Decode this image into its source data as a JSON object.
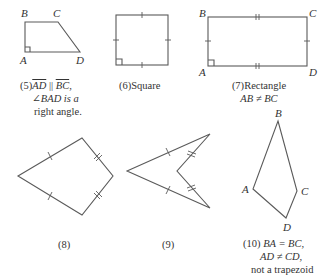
{
  "figures": [
    {
      "id": 5,
      "vertices": {
        "A": "A",
        "B": "B",
        "C": "C",
        "D": "D"
      },
      "caption": {
        "number": "(5)",
        "seg1": "AD",
        "parallel": "||",
        "seg2": "BC",
        "comma": ",",
        "line2": "∠BAD is a",
        "line3": "right angle."
      }
    },
    {
      "id": 6,
      "caption": {
        "number": "(6)",
        "text": "Square"
      }
    },
    {
      "id": 7,
      "vertices": {
        "A": "A",
        "B": "B",
        "C": "C",
        "D": "D"
      },
      "caption": {
        "number": "(7)",
        "text": "Rectangle",
        "line2": "AB ≠ BC"
      }
    },
    {
      "id": 8,
      "caption": {
        "number": "(8)"
      }
    },
    {
      "id": 9,
      "caption": {
        "number": "(9)"
      }
    },
    {
      "id": 10,
      "vertices": {
        "A": "A",
        "B": "B",
        "C": "C",
        "D": "D"
      },
      "caption": {
        "number": "(10)",
        "line1": "BA = BC,",
        "line2": "AD ≠ CD,",
        "line3": "not a trapezoid"
      }
    }
  ],
  "colors": {
    "stroke": "#5a5a5a",
    "text": "#333333",
    "background": "#ffffff"
  }
}
